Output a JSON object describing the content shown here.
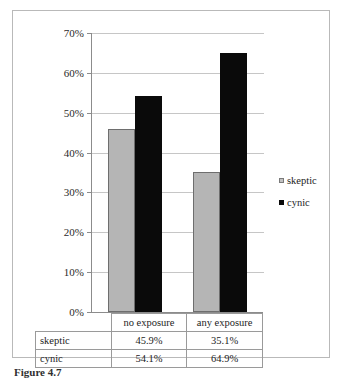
{
  "chart_data": {
    "type": "bar",
    "title": "",
    "xlabel": "",
    "ylabel": "",
    "categories": [
      "no exposure",
      "any exposure"
    ],
    "series": [
      {
        "name": "skeptic",
        "values": [
          45.9,
          35.1
        ],
        "color": "#b5b5b5"
      },
      {
        "name": "cynic",
        "values": [
          54.1,
          64.9
        ],
        "color": "#0a0a0a"
      }
    ],
    "ylim": [
      0,
      70
    ],
    "ytick_step": 10,
    "ytick_labels": [
      "0%",
      "10%",
      "20%",
      "30%",
      "40%",
      "50%",
      "60%",
      "70%"
    ],
    "value_labels": [
      [
        "45.9%",
        "35.1%"
      ],
      [
        "54.1%",
        "64.9%"
      ]
    ],
    "grid": true,
    "legend_position": "right"
  },
  "legend": {
    "items": [
      {
        "label": "skeptic",
        "marker": "gray-square-marker"
      },
      {
        "label": "cynic",
        "marker": "black-square-marker"
      }
    ]
  },
  "table": {
    "header": [
      "",
      "no exposure",
      "any exposure"
    ],
    "rows": [
      {
        "label": "skeptic",
        "cells": [
          "45.9%",
          "35.1%"
        ]
      },
      {
        "label": "cynic",
        "cells": [
          "54.1%",
          "64.9%"
        ]
      }
    ]
  },
  "caption": {
    "text": "Figure 4.7"
  }
}
